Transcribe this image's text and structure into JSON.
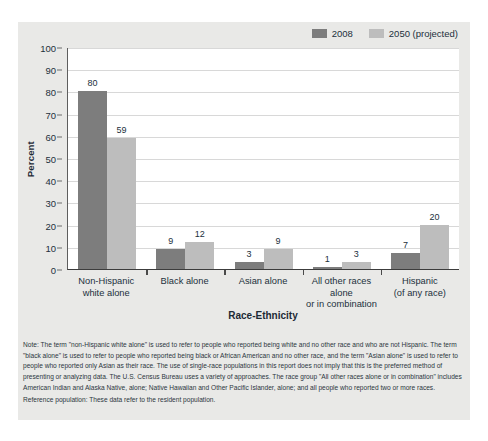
{
  "chart_data": {
    "type": "bar",
    "title": "",
    "xlabel": "Race-Ethnicity",
    "ylabel": "Percent",
    "ylim": [
      0,
      100
    ],
    "ytick_step": 10,
    "yticks": [
      100,
      90,
      80,
      70,
      60,
      50,
      40,
      30,
      20,
      10,
      0
    ],
    "grid": true,
    "legend_position": "top-right",
    "categories": [
      "Non-Hispanic white alone",
      "Black alone",
      "Asian alone",
      "All other races alone or in combination",
      "Hispanic (of any race)"
    ],
    "category_lines": [
      [
        "Non-Hispanic",
        "white alone"
      ],
      [
        "Black alone"
      ],
      [
        "Asian alone"
      ],
      [
        "All other races alone",
        "or in combination"
      ],
      [
        "Hispanic",
        "(of any race)"
      ]
    ],
    "series": [
      {
        "name": "2008",
        "color": "#7d7d7d",
        "values": [
          80,
          9,
          3,
          1,
          7
        ]
      },
      {
        "name": "2050 (projected)",
        "color": "#bdbdbd",
        "values": [
          59,
          12,
          9,
          3,
          20
        ]
      }
    ]
  },
  "legend": {
    "entries": [
      {
        "label": "2008",
        "color": "#7d7d7d"
      },
      {
        "label": "2050 (projected)",
        "color": "#bdbdbd"
      }
    ]
  },
  "notes": {
    "note": "Note: The term \"non-Hispanic white alone\" is used to refer to people who reported being white and no other race and who are not Hispanic. The term \"black alone\" is used to refer to people who reported being black or African American and no other race, and the term \"Asian alone\" is used to refer to people who reported only Asian as their race. The use of single-race populations in this report does not imply that this is the preferred method of presenting or analyzing data. The U.S. Census Bureau uses a variety of approaches. The race group \"All other races alone or in combination\" includes American Indian and Alaska Native, alone; Native Hawaiian and Other Pacific Islander, alone; and all people who reported two or more races.",
    "reference": "Reference population: These data refer to the resident population."
  },
  "colors": {
    "figure_background": "#e9e9e7",
    "plot_background": "#ffffff",
    "gridline": "#d8d8d8",
    "axis": "#4a4a4a",
    "text": "#22303c"
  }
}
